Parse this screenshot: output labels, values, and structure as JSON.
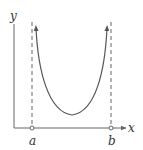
{
  "diagram": {
    "axes": {
      "x_label": "x",
      "y_label": "y"
    },
    "asymptotes": [
      {
        "label": "a",
        "x_px": 32
      },
      {
        "label": "b",
        "x_px": 111
      }
    ],
    "curve": {
      "shape": "U-shaped curve approaching vertical asymptotes at x=a and x=b, arrows pointing upward",
      "color": "#555555"
    },
    "colors": {
      "axis": "#666666",
      "dashed": "#666666",
      "curve": "#555555",
      "text": "#333333"
    }
  }
}
